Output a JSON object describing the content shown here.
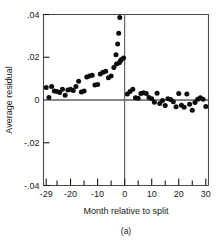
{
  "chart_data": {
    "type": "scatter",
    "title": "",
    "subtitle": "",
    "xlabel": "Month relative to split",
    "ylabel": "Average residual",
    "caption": "(a)",
    "xlim": [
      -30,
      31
    ],
    "ylim": [
      -0.04,
      0.04
    ],
    "grid": false,
    "legend": null,
    "x_ticks_labeled": [
      -29,
      -20,
      -10,
      0,
      10,
      20,
      30
    ],
    "x_tick_labels": [
      "-29",
      "-20",
      "-10",
      "0",
      "10",
      "20",
      "30"
    ],
    "x_ticks_minor": [
      -25,
      -15,
      -5,
      5,
      15,
      25
    ],
    "y_ticks": [
      0.04,
      0.02,
      0,
      -0.02,
      -0.04
    ],
    "y_tick_labels": [
      ".04",
      ".02",
      "0",
      "-.02",
      "-.04"
    ],
    "annotations": [
      {
        "type": "vline",
        "x": 0,
        "label": "split month reference line"
      },
      {
        "type": "hline",
        "y": 0,
        "label": "zero residual line"
      }
    ],
    "series": [
      {
        "name": "Average residual",
        "marker": "filled-circle",
        "color": "#0d0d0d",
        "points": [
          {
            "x": -29,
            "y": 0.0058
          },
          {
            "x": -28,
            "y": 0.0012
          },
          {
            "x": -27,
            "y": 0.0063
          },
          {
            "x": -26,
            "y": 0.0042
          },
          {
            "x": -25,
            "y": 0.004
          },
          {
            "x": -24,
            "y": 0.0035
          },
          {
            "x": -23,
            "y": 0.005
          },
          {
            "x": -22,
            "y": 0.0022
          },
          {
            "x": -21,
            "y": 0.0047
          },
          {
            "x": -20,
            "y": 0.005
          },
          {
            "x": -19,
            "y": 0.0044
          },
          {
            "x": -18,
            "y": 0.0063
          },
          {
            "x": -17,
            "y": 0.0088
          },
          {
            "x": -16,
            "y": 0.0038
          },
          {
            "x": -15,
            "y": 0.0042
          },
          {
            "x": -14,
            "y": 0.0108
          },
          {
            "x": -13,
            "y": 0.0112
          },
          {
            "x": -12,
            "y": 0.0116
          },
          {
            "x": -11,
            "y": 0.007
          },
          {
            "x": -10,
            "y": 0.0072
          },
          {
            "x": -9,
            "y": 0.0122
          },
          {
            "x": -8,
            "y": 0.013
          },
          {
            "x": -7,
            "y": 0.0134
          },
          {
            "x": -6,
            "y": 0.0104
          },
          {
            "x": -5,
            "y": 0.0112
          },
          {
            "x": -4,
            "y": 0.0152
          },
          {
            "x": -3,
            "y": 0.0168
          },
          {
            "x": -2,
            "y": 0.0174
          },
          {
            "x": -1.6,
            "y": 0.0182
          },
          {
            "x": -1.2,
            "y": 0.019
          },
          {
            "x": -3.2,
            "y": 0.0212
          },
          {
            "x": -2.6,
            "y": 0.0262
          },
          {
            "x": -2.2,
            "y": 0.0312
          },
          {
            "x": -1.8,
            "y": 0.0386
          },
          {
            "x": -0.4,
            "y": 0.0196
          },
          {
            "x": 1,
            "y": 0.0028
          },
          {
            "x": 2,
            "y": 0.004
          },
          {
            "x": 3,
            "y": 0.005
          },
          {
            "x": 4,
            "y": 0.001
          },
          {
            "x": 5,
            "y": 0.0008
          },
          {
            "x": 6,
            "y": 0.003
          },
          {
            "x": 7,
            "y": 0.0034
          },
          {
            "x": 8,
            "y": 0.003
          },
          {
            "x": 9,
            "y": 0.0012
          },
          {
            "x": 10,
            "y": 0.0006
          },
          {
            "x": 11,
            "y": -0.001
          },
          {
            "x": 12,
            "y": 0.0032
          },
          {
            "x": 13,
            "y": -0.0016
          },
          {
            "x": 14,
            "y": -0.0002
          },
          {
            "x": 15,
            "y": -0.0026
          },
          {
            "x": 16,
            "y": 0.0006
          },
          {
            "x": 17,
            "y": 0.0002
          },
          {
            "x": 18,
            "y": -0.0008
          },
          {
            "x": 19,
            "y": -0.0032
          },
          {
            "x": 20,
            "y": 0.003
          },
          {
            "x": 21,
            "y": -0.0024
          },
          {
            "x": 22,
            "y": -0.0034
          },
          {
            "x": 23,
            "y": 0.0028
          },
          {
            "x": 24,
            "y": -0.002
          },
          {
            "x": 25,
            "y": -0.0048
          },
          {
            "x": 26,
            "y": -0.0012
          },
          {
            "x": 27,
            "y": 0.0004
          },
          {
            "x": 28,
            "y": 0.001
          },
          {
            "x": 29,
            "y": 0.0004
          },
          {
            "x": 30,
            "y": -0.003
          }
        ]
      }
    ]
  }
}
